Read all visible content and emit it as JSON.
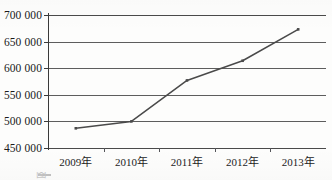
{
  "chart_data": {
    "type": "line",
    "title": "",
    "xlabel": "",
    "ylabel": "",
    "categories": [
      "2009年",
      "2010年",
      "2011年",
      "2012年",
      "2013年"
    ],
    "values": [
      487000,
      500000,
      577000,
      614000,
      673000
    ],
    "ylim": [
      450000,
      700000
    ],
    "ytick_values": [
      450000,
      500000,
      550000,
      600000,
      650000,
      700000
    ],
    "ytick_labels": [
      "450 000",
      "500 000",
      "550 000",
      "600 000",
      "650 000",
      "700 000"
    ],
    "grid": true,
    "legend": false,
    "series": [
      {
        "name": "",
        "values": [
          487000,
          500000,
          577000,
          614000,
          673000
        ],
        "color": "#4a4a4a",
        "marker": "square"
      }
    ]
  },
  "figure": {
    "caption_partial": "图",
    "line_color": "#4a4a4a",
    "grid_color": "#5d5d5d",
    "axis_color": "#3a3a3a",
    "background": "#fdfdfc"
  }
}
